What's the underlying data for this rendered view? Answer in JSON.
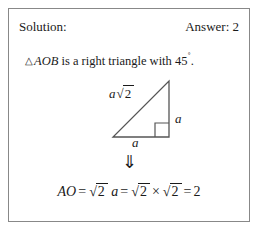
{
  "card": {
    "header": {
      "solution_label": "Solution:",
      "answer_label": "Answer: 2"
    },
    "statement": {
      "triangle_symbol": "△",
      "triangle_name": "AOB",
      "text_rest": "is a right triangle with 45",
      "degree_symbol": "˚",
      "period": "."
    },
    "figure": {
      "name": "right-triangle-45-45-90",
      "hypotenuse_label": {
        "coefficient": "a",
        "radical": "√",
        "radicand": "2"
      },
      "vertical_leg_label": "a",
      "base_leg_label": "a",
      "right_angle_marker": "right-angle-square"
    },
    "implies_arrow": "⇓",
    "equation": {
      "lhs": "AO",
      "eq1": "=",
      "term1_radical": "√",
      "term1_radicand": "2",
      "term1_var": "a",
      "eq2": "=",
      "term2_radical": "√",
      "term2_radicand": "2",
      "times": "×",
      "term3_radical": "√",
      "term3_radicand": "2",
      "eq3": "=",
      "result": "2"
    }
  },
  "colors": {
    "border": "#888888",
    "ink": "#1a1a1a",
    "figure_line": "#555555",
    "background": "#ffffff"
  }
}
